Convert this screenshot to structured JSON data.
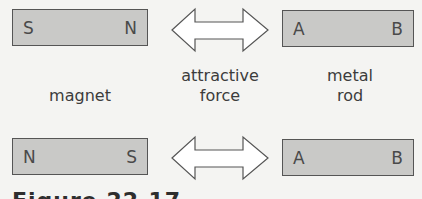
{
  "diagram": {
    "top_row": {
      "magnet": {
        "left_pole": "S",
        "right_pole": "N"
      },
      "rod": {
        "left_end": "A",
        "right_end": "B"
      }
    },
    "bottom_row": {
      "magnet": {
        "left_pole": "N",
        "right_pole": "S"
      },
      "rod": {
        "left_end": "A",
        "right_end": "B"
      }
    },
    "labels": {
      "magnet": "magnet",
      "force_line1": "attractive",
      "force_line2": "force",
      "rod_line1": "metal",
      "rod_line2": "rod"
    },
    "caption": "Figure 22.17",
    "colors": {
      "bar_fill": "#c9c9c7",
      "bar_border": "#555555",
      "background": "#f4f4f2"
    }
  }
}
